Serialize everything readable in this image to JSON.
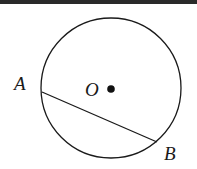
{
  "figure": {
    "type": "circle-with-chord",
    "circle": {
      "cx": 111,
      "cy": 88,
      "r": 70,
      "stroke": "#1a1a1a"
    },
    "center": {
      "label": "O",
      "x": 111,
      "y": 89
    },
    "points": [
      {
        "label": "A",
        "x": 42,
        "y": 92
      },
      {
        "label": "B",
        "x": 157,
        "y": 142
      }
    ],
    "chord": {
      "from": "A",
      "to": "B"
    }
  }
}
